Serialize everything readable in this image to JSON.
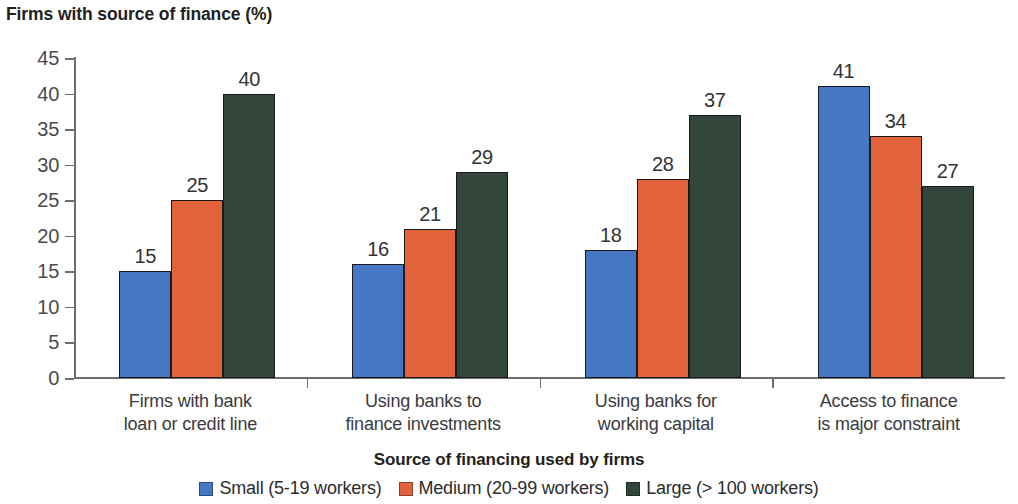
{
  "chart_data": {
    "type": "bar",
    "title": "Firms with source of finance (%)",
    "xlabel": "Source of financing used by firms",
    "ylabel": "",
    "ylim": [
      0,
      45
    ],
    "yticks": [
      0,
      5,
      10,
      15,
      20,
      25,
      30,
      35,
      40,
      45
    ],
    "grid": false,
    "legend_position": "bottom",
    "categories": [
      "Firms with bank loan or credit line",
      "Using banks to finance investments",
      "Using banks for working capital",
      "Access to finance is major constraint"
    ],
    "category_lines": [
      [
        "Firms with bank",
        "loan or credit line"
      ],
      [
        "Using banks to",
        "finance investments"
      ],
      [
        "Using banks for",
        "working capital"
      ],
      [
        "Access to finance",
        "is major constraint"
      ]
    ],
    "series": [
      {
        "name": "Small (5-19 workers)",
        "color": "#4577c4",
        "values": [
          15,
          16,
          18,
          41
        ]
      },
      {
        "name": "Medium (20-99 workers)",
        "color": "#e2623c",
        "values": [
          25,
          21,
          28,
          34
        ]
      },
      {
        "name": "Large (> 100 workers)",
        "color": "#33463c",
        "values": [
          40,
          29,
          37,
          27
        ]
      }
    ]
  },
  "colors": {
    "small": "#4577c4",
    "medium": "#e2623c",
    "large": "#33463c",
    "axis": "#6d6e71",
    "text": "#231f20",
    "background": "#ffffff"
  }
}
